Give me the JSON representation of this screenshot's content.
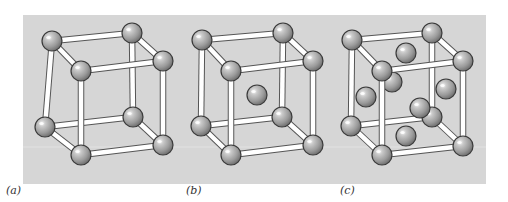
{
  "figure": {
    "panel": {
      "x": 23,
      "y": 15,
      "width": 463,
      "height": 169,
      "color": "#d6d6d6"
    },
    "colors": {
      "rod_fill": "#ffffff",
      "rod_edge": "#555555",
      "sphere_light": "#ececec",
      "sphere_mid": "#a8a8a8",
      "sphere_dark": "#777777",
      "sphere_edge": "#3a3a3a"
    },
    "sphere_radius": 10,
    "cubes": [
      {
        "id": "a",
        "label": "(a)",
        "label_x": 6,
        "name": "simple cubic",
        "corners": {
          "btl": [
            52,
            41
          ],
          "btr": [
            132,
            33
          ],
          "ftl": [
            81,
            71
          ],
          "ftr": [
            163,
            61
          ],
          "bbl": [
            45,
            127
          ],
          "bbr": [
            133,
            117
          ],
          "fbl": [
            81,
            155
          ],
          "fbr": [
            163,
            145
          ]
        },
        "extra_behind": [],
        "extra_front": []
      },
      {
        "id": "b",
        "label": "(b)",
        "label_x": 186,
        "name": "body-centered cubic",
        "corners": {
          "btl": [
            202,
            40
          ],
          "btr": [
            283,
            33
          ],
          "ftl": [
            231,
            71
          ],
          "ftr": [
            313,
            61
          ],
          "bbl": [
            201,
            126
          ],
          "bbr": [
            282,
            117
          ],
          "fbl": [
            231,
            155
          ],
          "fbr": [
            313,
            145
          ]
        },
        "extra_behind": [
          [
            257,
            95
          ]
        ],
        "extra_front": []
      },
      {
        "id": "c",
        "label": "(c)",
        "label_x": 340,
        "name": "face-centered cubic",
        "corners": {
          "btl": [
            352,
            40
          ],
          "btr": [
            432,
            33
          ],
          "ftl": [
            382,
            71
          ],
          "ftr": [
            463,
            61
          ],
          "bbl": [
            351,
            126
          ],
          "bbr": [
            432,
            117
          ],
          "fbl": [
            382,
            155
          ],
          "fbr": [
            463,
            146
          ]
        },
        "extra_behind": [
          [
            406,
            53
          ],
          [
            392,
            82
          ],
          [
            366,
            97
          ],
          [
            446,
            89
          ],
          [
            406,
            136
          ]
        ],
        "extra_front": [
          [
            420,
            108
          ]
        ]
      }
    ]
  }
}
